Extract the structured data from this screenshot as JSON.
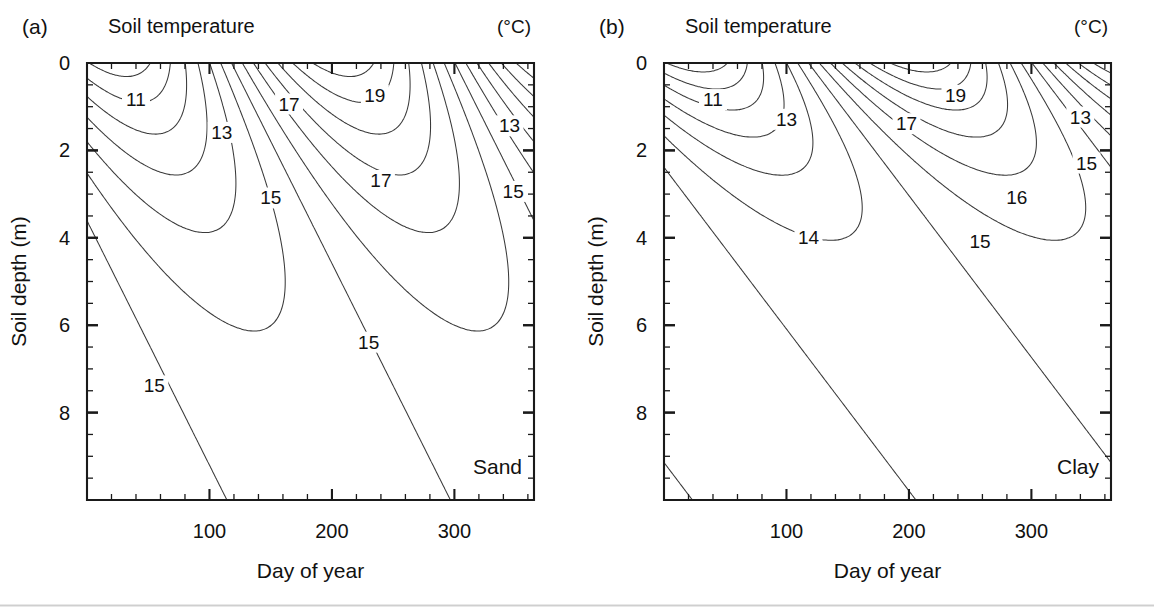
{
  "figure": {
    "background": "#ffffff",
    "line_color": "#3a3a3a",
    "axis_color": "#1a1a1a"
  },
  "panels": [
    {
      "id": "a",
      "tag": "(a)",
      "title": "Soil temperature",
      "unit": "(°C)",
      "corner_label": "Sand",
      "xlabel": "Day of year",
      "ylabel": "Soil depth (m)",
      "xticks": [
        "100",
        "200",
        "300"
      ],
      "yticks": [
        "0",
        "2",
        "4",
        "6",
        "8"
      ],
      "contour_labels": [
        {
          "text": "11",
          "x": 40,
          "y": 0.85
        },
        {
          "text": "13",
          "x": 110,
          "y": 1.6
        },
        {
          "text": "17",
          "x": 165,
          "y": 0.95
        },
        {
          "text": "19",
          "x": 235,
          "y": 0.75
        },
        {
          "text": "17",
          "x": 240,
          "y": 2.7
        },
        {
          "text": "13",
          "x": 345,
          "y": 1.45
        },
        {
          "text": "15",
          "x": 150,
          "y": 3.1
        },
        {
          "text": "15",
          "x": 348,
          "y": 2.95
        },
        {
          "text": "15",
          "x": 230,
          "y": 6.4
        },
        {
          "text": "15",
          "x": 55,
          "y": 7.4
        }
      ]
    },
    {
      "id": "b",
      "tag": "(b)",
      "title": "Soil temperature",
      "unit": "(°C)",
      "corner_label": "Clay",
      "xlabel": "Day of year",
      "ylabel": "Soil depth (m)",
      "xticks": [
        "100",
        "200",
        "300"
      ],
      "yticks": [
        "0",
        "2",
        "4",
        "6",
        "8"
      ],
      "contour_labels": [
        {
          "text": "11",
          "x": 40,
          "y": 0.85
        },
        {
          "text": "13",
          "x": 100,
          "y": 1.3
        },
        {
          "text": "17",
          "x": 198,
          "y": 1.4
        },
        {
          "text": "19",
          "x": 238,
          "y": 0.75
        },
        {
          "text": "13",
          "x": 340,
          "y": 1.25
        },
        {
          "text": "15",
          "x": 345,
          "y": 2.3
        },
        {
          "text": "16",
          "x": 288,
          "y": 3.1
        },
        {
          "text": "14",
          "x": 118,
          "y": 4.0
        },
        {
          "text": "15",
          "x": 258,
          "y": 4.1
        }
      ]
    }
  ],
  "chart_data": {
    "type": "line",
    "subtype": "contour",
    "title": "Soil temperature",
    "xlabel": "Day of year",
    "ylabel": "Soil depth (m)",
    "unit": "°C",
    "xlim": [
      0,
      365
    ],
    "ylim": [
      0,
      10
    ],
    "y_inverted": true,
    "xtick_values": [
      100,
      200,
      300
    ],
    "xtick_minor_step": 20,
    "ytick_values": [
      0,
      2,
      4,
      6,
      8
    ],
    "ytick_minor_step": 0.5,
    "grid": false,
    "legend": null,
    "panels": [
      {
        "name": "Sand",
        "tag": "(a)",
        "contour_levels": [
          9,
          10,
          11,
          12,
          13,
          14,
          15,
          16,
          17,
          18,
          19,
          20,
          21,
          13,
          15
        ],
        "labeled_levels": [
          11,
          13,
          15,
          17,
          19
        ],
        "description": "Annual soil temperature wave in sand; amplitude damps with depth, phase lags with depth. Closed cold loop (11, 13) near day 20-110 in upper 3 m, warm loops (17, 19) near day 180-260, 15 deg C isotherm penetrates past 10 m near day 105 and day 295.",
        "surface_minimum_day": 30,
        "surface_maximum_day": 215,
        "deep_mean_temperature": 15,
        "damping_depth_m": 3.2,
        "isotherm_15_bottom_crossings_day": [
          105,
          292
        ]
      },
      {
        "name": "Clay",
        "tag": "(b)",
        "contour_levels": [
          9,
          10,
          11,
          12,
          13,
          14,
          15,
          16,
          17,
          18,
          19,
          20,
          21
        ],
        "labeled_levels": [
          11,
          13,
          14,
          15,
          16,
          17,
          19
        ],
        "description": "Annual soil temperature wave in clay; stronger damping than sand so isotherms close off above 5.5 m. Cold loop 14 reaches ~4.7 m near day 140; warm 15 isotherm bends to right edge at ~5.3 m.",
        "surface_minimum_day": 30,
        "surface_maximum_day": 215,
        "deep_mean_temperature": 15,
        "damping_depth_m": 2.2,
        "isotherm_15_right_edge_depth_m": 5.3
      }
    ]
  }
}
